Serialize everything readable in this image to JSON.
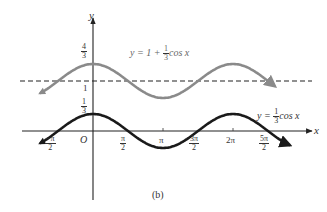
{
  "figure": {
    "caption": "(b)",
    "axes": {
      "x_label": "x",
      "y_label": "y",
      "origin_label": "O"
    },
    "x_ticks": [
      {
        "num": "−π",
        "den": "2",
        "prefix": ""
      },
      {
        "num": "π",
        "den": "2"
      },
      {
        "label": "π"
      },
      {
        "num": "3π",
        "den": "2"
      },
      {
        "label": "2π"
      },
      {
        "num": "5π",
        "den": "2"
      }
    ],
    "y_ticks": [
      {
        "num": "4",
        "den": "3"
      },
      {
        "label": "1"
      },
      {
        "num": "1",
        "den": "3"
      }
    ],
    "curve_labels": {
      "upper": {
        "prefix": "y = 1 + ",
        "num": "1",
        "den": "3",
        "suffix": "cos x"
      },
      "lower": {
        "prefix": "y = ",
        "num": "1",
        "den": "3",
        "suffix": "cos x"
      }
    },
    "colors": {
      "upper_curve": "#8a8a8a",
      "lower_curve": "#1a1a1a",
      "axes": "#222222",
      "dashed": "#222222"
    }
  },
  "chart_data": {
    "type": "line",
    "title": "",
    "caption": "(b)",
    "xlabel": "x",
    "ylabel": "y",
    "x_tick_labels": [
      "-π/2",
      "O",
      "π/2",
      "π",
      "3π/2",
      "2π",
      "5π/2"
    ],
    "y_tick_labels": [
      "1/3",
      "1",
      "4/3"
    ],
    "xlim": [
      "-3π/4",
      "11π/4"
    ],
    "ylim": [
      -0.4,
      1.7
    ],
    "grid": false,
    "series": [
      {
        "name": "y = 1 + (1/3)cos x",
        "color": "gray",
        "x": [
          -0.75,
          -0.5,
          0,
          0.5,
          1,
          1.5,
          2,
          2.5
        ],
        "x_units": "π",
        "values": [
          0.764,
          1.0,
          1.333,
          1.0,
          0.667,
          1.0,
          1.333,
          1.0
        ]
      },
      {
        "name": "y = (1/3)cos x",
        "color": "black",
        "x": [
          -0.75,
          -0.5,
          0,
          0.5,
          1,
          1.5,
          2,
          2.5
        ],
        "x_units": "π",
        "values": [
          -0.236,
          0.0,
          0.333,
          0.0,
          -0.333,
          0.0,
          0.333,
          0.0
        ]
      },
      {
        "name": "y = 1 (asymptote/midline)",
        "style": "dashed",
        "values": [
          1,
          1
        ]
      }
    ]
  }
}
